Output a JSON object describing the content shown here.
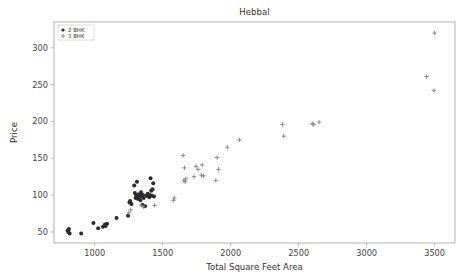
{
  "chart_data": {
    "type": "scatter",
    "title": "Hebbal",
    "xlabel": "Total Square Feet Area",
    "ylabel": "Price",
    "xlim": [
      700,
      3650
    ],
    "ylim": [
      35,
      335
    ],
    "xticks": [
      1000,
      1500,
      2000,
      2500,
      3000,
      3500
    ],
    "yticks": [
      50,
      100,
      150,
      200,
      250,
      300
    ],
    "grid": false,
    "legend_position": "upper-left",
    "series": [
      {
        "name": "2 BHK",
        "marker": "circle",
        "color": "#2b2b2b",
        "points": [
          [
            800,
            52
          ],
          [
            805,
            50
          ],
          [
            810,
            54
          ],
          [
            815,
            48
          ],
          [
            900,
            48
          ],
          [
            990,
            62
          ],
          [
            1025,
            55
          ],
          [
            1060,
            57
          ],
          [
            1075,
            60
          ],
          [
            1080,
            58
          ],
          [
            1090,
            61
          ],
          [
            1160,
            69
          ],
          [
            1245,
            72
          ],
          [
            1255,
            90
          ],
          [
            1260,
            92
          ],
          [
            1270,
            88
          ],
          [
            1290,
            113
          ],
          [
            1295,
            103
          ],
          [
            1300,
            96
          ],
          [
            1305,
            99
          ],
          [
            1310,
            118
          ],
          [
            1315,
            95
          ],
          [
            1320,
            101
          ],
          [
            1325,
            97
          ],
          [
            1330,
            100
          ],
          [
            1335,
            93
          ],
          [
            1340,
            104
          ],
          [
            1345,
            98
          ],
          [
            1350,
            87
          ],
          [
            1355,
            100
          ],
          [
            1360,
            96
          ],
          [
            1370,
            85
          ],
          [
            1380,
            99
          ],
          [
            1390,
            102
          ],
          [
            1400,
            97
          ],
          [
            1405,
            100
          ],
          [
            1410,
            123
          ],
          [
            1415,
            106
          ],
          [
            1420,
            99
          ],
          [
            1425,
            108
          ],
          [
            1430,
            116
          ],
          [
            1435,
            98
          ]
        ]
      },
      {
        "name": "3 BHK",
        "marker": "plus",
        "color": "#7a7a8c",
        "points": [
          [
            1250,
            76
          ],
          [
            1265,
            80
          ],
          [
            1345,
            86
          ],
          [
            1360,
            84
          ],
          [
            1440,
            86
          ],
          [
            1580,
            93
          ],
          [
            1585,
            96
          ],
          [
            1650,
            154
          ],
          [
            1655,
            120
          ],
          [
            1660,
            137
          ],
          [
            1665,
            118
          ],
          [
            1670,
            122
          ],
          [
            1730,
            125
          ],
          [
            1745,
            139
          ],
          [
            1760,
            135
          ],
          [
            1785,
            127
          ],
          [
            1790,
            141
          ],
          [
            1800,
            126
          ],
          [
            1890,
            120
          ],
          [
            1900,
            151
          ],
          [
            1910,
            135
          ],
          [
            1975,
            165
          ],
          [
            2065,
            175
          ],
          [
            2380,
            196
          ],
          [
            2390,
            180
          ],
          [
            2600,
            197
          ],
          [
            2610,
            196
          ],
          [
            2650,
            199
          ],
          [
            3440,
            261
          ],
          [
            3495,
            242
          ],
          [
            3500,
            320
          ]
        ]
      }
    ]
  },
  "legend": {
    "entries": [
      {
        "label": "2 BHK"
      },
      {
        "label": "3 BHK"
      }
    ]
  }
}
